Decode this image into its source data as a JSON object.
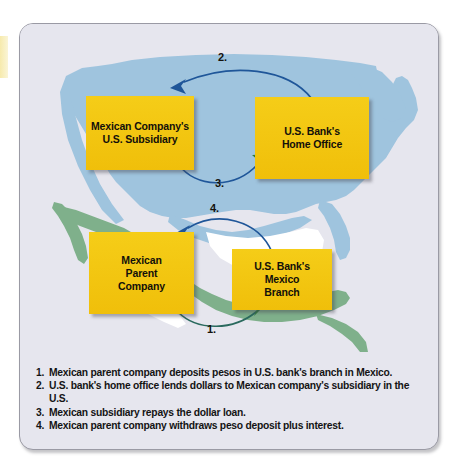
{
  "figure": {
    "type": "process-flow-diagram",
    "background_map": "map of United States (light blue) and Mexico / Central America (green) with surrounding water",
    "colors": {
      "panel_background": "#e6e6ee",
      "panel_border": "#9a9aa4",
      "usa_fill": "#9fc4de",
      "mexico_fill": "#7fb08b",
      "water_fill": "#ffffff",
      "box_fill": "#f3c511",
      "box_text": "#12100a",
      "arrow_blue": "#1f5699",
      "arrow_green": "#2f7a3f",
      "caption_text": "#141414",
      "left_tab": "#f6e9a8"
    }
  },
  "boxes": [
    {
      "id": "mexican-company-us-subsidiary",
      "lines": [
        "Mexican Company's",
        "U.S. Subsidiary"
      ],
      "region": "United States"
    },
    {
      "id": "us-bank-home-office",
      "lines": [
        "U.S. Bank's",
        "Home Office"
      ],
      "region": "United States"
    },
    {
      "id": "mexican-parent-company",
      "lines": [
        "Mexican",
        "Parent",
        "Company"
      ],
      "region": "Mexico"
    },
    {
      "id": "us-bank-mexico-branch",
      "lines": [
        "U.S. Bank's",
        "Mexico",
        "Branch"
      ],
      "region": "Mexico"
    }
  ],
  "box_text": {
    "subsidiary": "Mexican Company's\nU.S. Subsidiary",
    "home_office": "U.S. Bank's\nHome Office",
    "parent": "Mexican\nParent\nCompany",
    "mexico_branch": "U.S. Bank's\nMexico\nBranch"
  },
  "arrows": [
    {
      "label": "1.",
      "from": "mexican-parent-company",
      "to": "us-bank-mexico-branch",
      "head_color": "green",
      "curve": "below"
    },
    {
      "label": "2.",
      "from": "us-bank-home-office",
      "to": "mexican-company-us-subsidiary",
      "head_color": "blue",
      "curve": "above"
    },
    {
      "label": "3.",
      "from": "mexican-company-us-subsidiary",
      "to": "us-bank-home-office",
      "head_color": "green",
      "curve": "below"
    },
    {
      "label": "4.",
      "from": "us-bank-mexico-branch",
      "to": "mexican-parent-company",
      "head_color": "blue",
      "curve": "above"
    }
  ],
  "arrow_labels": {
    "one": "1.",
    "two": "2.",
    "three": "3.",
    "four": "4."
  },
  "caption": {
    "items": [
      {
        "num": "1.",
        "text": "Mexican parent company deposits pesos in U.S. bank's branch in Mexico."
      },
      {
        "num": "2.",
        "text": "U.S. bank's home office lends dollars to Mexican company's subsidiary in the U.S."
      },
      {
        "num": "3.",
        "text": "Mexican subsidiary repays the dollar loan."
      },
      {
        "num": "4.",
        "text": "Mexican parent company withdraws peso deposit plus interest."
      }
    ]
  }
}
